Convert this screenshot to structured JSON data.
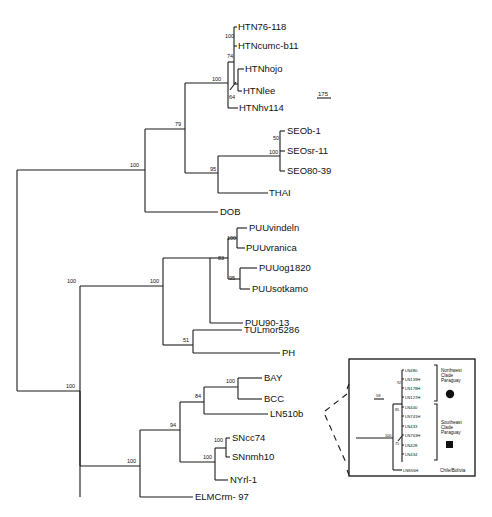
{
  "figure": {
    "type": "phylogenetic-tree",
    "scale_bar": "175",
    "inset_scale_bar": "58"
  },
  "leaves": {
    "htn76": "HTN76-118",
    "htncumc": "HTNcumc-b11",
    "htnhojo": "HTNhojo",
    "htnlee": "HTNlee",
    "htnhv": "HTNhv114",
    "seob1": "SEOb-1",
    "seosr": "SEOsr-11",
    "seo80": "SEO80-39",
    "thai": "THAI",
    "dob": "DOB",
    "puuvind": "PUUvindeln",
    "puuvran": "PUUvranica",
    "puuog": "PUUog1820",
    "puusot": "PUUsotkamo",
    "puu90": "PUU90-13",
    "tul": "TULmor5286",
    "ph": "PH",
    "bay": "BAY",
    "bcc": "BCC",
    "ln510": "LN510b",
    "sncc": "SNcc74",
    "snnmh": "SNnmh10",
    "nyri": "NYrl-1",
    "elmc": "ELMCrm- 97"
  },
  "bootstrap": {
    "htn_pair": "100",
    "htn_74": "74",
    "htn_root": "100",
    "htn_64": "64",
    "seo_50": "50",
    "seo_100": "100",
    "seo_thai": "95",
    "htn_seo": "79",
    "upper_root": "100",
    "puu_vind": "100",
    "puu_83": "83",
    "puu_95": "95",
    "puu_root": "100",
    "tul_ph": "51",
    "puu_tul": "100",
    "bay_bcc": "100",
    "bay_ln": "84",
    "sn_pair": "100",
    "sn_ny": "100",
    "sn_94": "94",
    "sn_elmc": "100",
    "lower_root": "100"
  },
  "inset": {
    "leaves": [
      "LN480",
      "LN139H",
      "LN178H",
      "LN127H",
      "LN440",
      "LN741H",
      "LN433",
      "LN763H",
      "LN428",
      "LN434",
      "LN855H"
    ],
    "bootstrap": {
      "b92": "92",
      "b85": "85",
      "b100": "100",
      "b75": "75"
    },
    "groups": {
      "northwest": [
        "Northwest",
        "Clade",
        "Paraguay"
      ],
      "southeast": [
        "Southeast",
        "Clade",
        "Paraguay"
      ],
      "chile": "Chile/Bolivia"
    },
    "symbols": {
      "northwest": "circle",
      "southeast": "square"
    }
  }
}
